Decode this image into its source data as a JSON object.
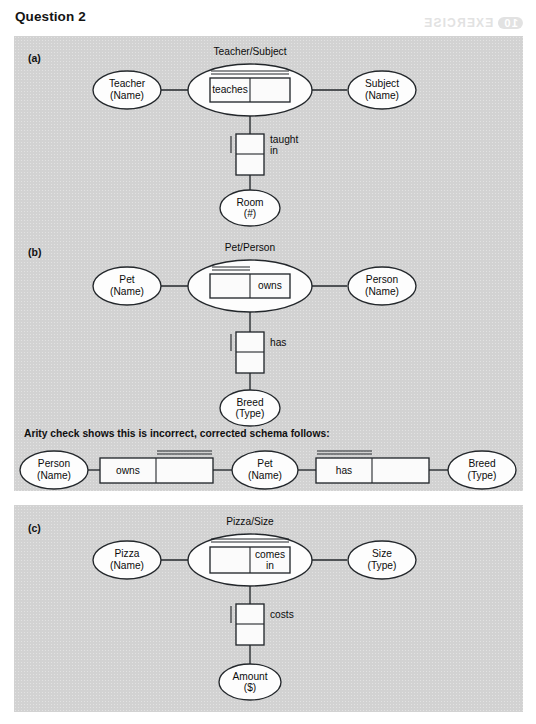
{
  "page": {
    "title": "Question 2",
    "bleed_through": {
      "badge": "10",
      "text": "EXERCISE",
      "subtext": "Question 2"
    }
  },
  "sections": [
    {
      "key": "a",
      "label": "(a)"
    },
    {
      "key": "b",
      "label": "(b)"
    },
    {
      "key": "c",
      "label": "(c)"
    }
  ],
  "arity_note": "Arity check shows this is incorrect, corrected schema follows:",
  "diagrams": {
    "a": {
      "title": "Teacher/Subject",
      "left_entity": {
        "name": "Teacher",
        "attribute": "(Name)"
      },
      "right_entity": {
        "name": "Subject",
        "attribute": "(Name)"
      },
      "bottom_entity": {
        "name": "Room",
        "attribute": "(#)"
      },
      "relationship": {
        "label": "teaches",
        "label_cell": "left",
        "arity_line": "full"
      },
      "vertical_relationship": {
        "label_line1": "taught",
        "label_line2": "in",
        "arity_mark": "left"
      }
    },
    "b": {
      "title": "Pet/Person",
      "left_entity": {
        "name": "Pet",
        "attribute": "(Name)"
      },
      "right_entity": {
        "name": "Person",
        "attribute": "(Name)"
      },
      "bottom_entity": {
        "name": "Breed",
        "attribute": "(Type)"
      },
      "relationship": {
        "label": "owns",
        "label_cell": "right",
        "arity_line": "left"
      },
      "vertical_relationship": {
        "label_line1": "has",
        "label_line2": "",
        "arity_mark": "left"
      }
    },
    "c": {
      "title": "Pizza/Size",
      "left_entity": {
        "name": "Pizza",
        "attribute": "(Name)"
      },
      "right_entity": {
        "name": "Size",
        "attribute": "(Type)"
      },
      "bottom_entity": {
        "name": "Amount",
        "attribute": "($)"
      },
      "relationship": {
        "label_line1": "comes",
        "label_line2": "in",
        "label_cell": "right",
        "arity_line": "full"
      },
      "vertical_relationship": {
        "label_line1": "costs",
        "label_line2": "",
        "arity_mark": "left"
      }
    }
  },
  "corrected_schema": {
    "entity1": {
      "name": "Person",
      "attribute": "(Name)"
    },
    "rel1": {
      "label": "owns",
      "label_cell": "left",
      "arity_line": "right"
    },
    "entity2": {
      "name": "Pet",
      "attribute": "(Name)"
    },
    "rel2": {
      "label": "has",
      "label_cell": "left",
      "arity_line": "left"
    },
    "entity3": {
      "name": "Breed",
      "attribute": "(Type)"
    }
  },
  "colors": {
    "panel_bg": "#d2d2d2",
    "page_bg": "#ffffff",
    "stroke": "#23272b",
    "shape_fill": "#fdfdfd",
    "text": "#0c0c0c",
    "bleed": "#e2e2e2"
  }
}
